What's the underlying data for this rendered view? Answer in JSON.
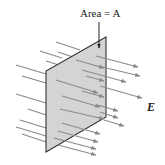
{
  "figure": {
    "area_label": "Area = A",
    "field_label": "E",
    "colors": {
      "plate_fill": "#d4d4d4",
      "plate_edge": "#333333",
      "arrow": "#8a8a8a",
      "pointer": "#222222"
    },
    "plate": {
      "points": [
        [
          106,
          37
        ],
        [
          46,
          71
        ],
        [
          46,
          152
        ],
        [
          106,
          117
        ]
      ]
    },
    "pointer_arrow": {
      "x": 99,
      "y1": 22,
      "y2": 48
    },
    "field_arrows_behind": [
      [
        16,
        65,
        46,
        74
      ],
      [
        22,
        76,
        46,
        83
      ],
      [
        16,
        94,
        46,
        103
      ],
      [
        28,
        109,
        46,
        115
      ],
      [
        20,
        120,
        46,
        128
      ],
      [
        16,
        127,
        46,
        136
      ],
      [
        22,
        134,
        46,
        142
      ],
      [
        56,
        42,
        80,
        50
      ],
      [
        40,
        51,
        62,
        58
      ],
      [
        58,
        52,
        76,
        58
      ],
      [
        46,
        61,
        62,
        66
      ]
    ],
    "field_arrows_front": [
      [
        56,
        80,
        98,
        93
      ],
      [
        62,
        96,
        100,
        107
      ],
      [
        60,
        109,
        104,
        119
      ],
      [
        62,
        123,
        100,
        134
      ],
      [
        58,
        131,
        98,
        142
      ],
      [
        54,
        138,
        96,
        149
      ],
      [
        58,
        145,
        96,
        155
      ],
      [
        76,
        60,
        104,
        68
      ],
      [
        86,
        76,
        104,
        81
      ],
      [
        82,
        91,
        104,
        97
      ]
    ],
    "field_arrows_out": [
      [
        96,
        56,
        138,
        67
      ],
      [
        98,
        66,
        140,
        76
      ],
      [
        82,
        70,
        126,
        82
      ],
      [
        100,
        86,
        142,
        98
      ],
      [
        98,
        105,
        118,
        111
      ],
      [
        100,
        112,
        118,
        118
      ],
      [
        104,
        120,
        124,
        126
      ]
    ]
  }
}
